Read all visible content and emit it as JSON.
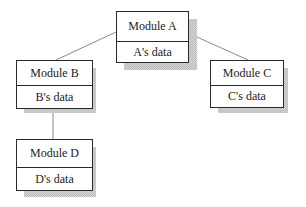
{
  "diagram": {
    "modules": [
      {
        "id": "A",
        "name": "Module A",
        "data": "A's data",
        "x": 116,
        "y": 11,
        "w": 72,
        "h": 52,
        "divider": 29
      },
      {
        "id": "B",
        "name": "Module B",
        "data": "B's data",
        "x": 16,
        "y": 60,
        "w": 76,
        "h": 48,
        "divider": 24
      },
      {
        "id": "C",
        "name": "Module C",
        "data": "C's data",
        "x": 210,
        "y": 60,
        "w": 73,
        "h": 48,
        "divider": 24
      },
      {
        "id": "D",
        "name": "Module D",
        "data": "D's data",
        "x": 16,
        "y": 139,
        "w": 76,
        "h": 52,
        "divider": 27
      }
    ],
    "connections": [
      {
        "from": "A",
        "to": "B"
      },
      {
        "from": "A",
        "to": "C"
      },
      {
        "from": "B",
        "to": "D"
      }
    ],
    "colors": {
      "border": "#2a2a2a",
      "line": "#8a8a8a",
      "shadow": "#c8c8c8"
    }
  }
}
